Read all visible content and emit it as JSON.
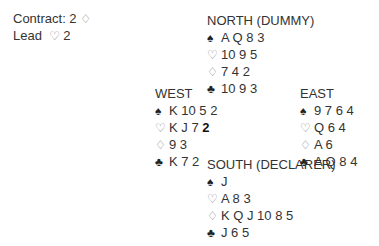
{
  "info": {
    "contract_label": "Contract: 2",
    "contract_suit": "♢",
    "lead_label": "Lead",
    "lead_suit": "♡",
    "lead_card": "2"
  },
  "suits": {
    "spades": "♠",
    "hearts": "♡",
    "diamonds": "♢",
    "clubs": "♣"
  },
  "hands": {
    "north": {
      "title": "NORTH (DUMMY)",
      "spades": "A Q 8 3",
      "hearts": "10 9 5",
      "diamonds": "7 4 2",
      "clubs": "10 9 3"
    },
    "west": {
      "title": "WEST",
      "spades": "K 10 5 2",
      "hearts": "K J 7",
      "hearts_led": "2",
      "diamonds": "9 3",
      "clubs": "K 7 2"
    },
    "east": {
      "title": "EAST",
      "spades": "9 7 6 4",
      "hearts": "Q 6 4",
      "diamonds": "A 6",
      "clubs": "A Q 8 4"
    },
    "south": {
      "title": "SOUTH (DECLARER)",
      "spades": "J",
      "hearts": "A 8 3",
      "diamonds": "K Q J 10 8 5",
      "clubs": "J 6 5"
    }
  }
}
